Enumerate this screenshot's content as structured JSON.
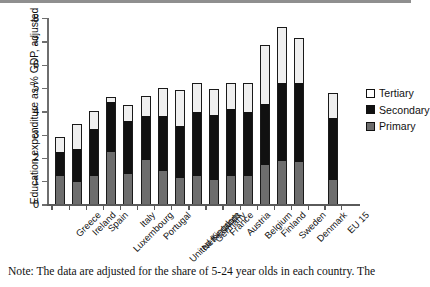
{
  "figure": {
    "note": "Note: The data are adjusted for the share of 5-24 year olds in each country. The"
  },
  "legend": {
    "position": "right",
    "items": [
      {
        "label": "Tertiary",
        "color": "#ffffff"
      },
      {
        "label": "Secondary",
        "color": "#111111"
      },
      {
        "label": "Primary",
        "color": "#6d6d6d"
      }
    ]
  },
  "chart_data": {
    "type": "bar",
    "stacked": true,
    "title": "",
    "subtitle": "",
    "xlabel": "",
    "ylabel": "Education expenditure as % GDP, adjusted",
    "ylim": [
      0,
      8
    ],
    "yticks": [
      0,
      1,
      2,
      3,
      4,
      5,
      6,
      7,
      8
    ],
    "ytick_labels": [
      "0",
      "1",
      "2",
      "3",
      "4",
      "5",
      "6",
      "7",
      "8"
    ],
    "grid": false,
    "categories": [
      "Greece",
      "Ireland",
      "Spain",
      "Luxembourg",
      "Italy",
      "Portugal",
      "United Kingdom",
      "Netherlands",
      "Germany",
      "France",
      "Austria",
      "Belgium",
      "Finland",
      "Sweden",
      "Denmark",
      "EU 15"
    ],
    "series": [
      {
        "name": "Primary",
        "color": "#6d6d6d",
        "values": [
          1.2,
          0.95,
          1.2,
          2.25,
          1.3,
          1.9,
          1.45,
          1.15,
          1.2,
          1.05,
          1.2,
          1.2,
          1.7,
          1.85,
          1.8,
          1.05
        ]
      },
      {
        "name": "Secondary",
        "color": "#111111",
        "values": [
          1.05,
          1.45,
          2.05,
          2.15,
          2.3,
          1.9,
          2.33,
          2.2,
          2.75,
          2.8,
          2.9,
          2.78,
          2.6,
          3.35,
          3.4,
          2.65
        ]
      },
      {
        "name": "Tertiary",
        "color": "#efefef",
        "values": [
          0.65,
          1.05,
          0.75,
          0.2,
          0.65,
          0.85,
          1.22,
          1.55,
          1.25,
          1.1,
          1.1,
          1.22,
          2.55,
          2.4,
          1.95,
          1.1
        ]
      }
    ],
    "totals": [
      2.9,
      3.45,
      4.0,
      4.6,
      4.25,
      4.65,
      5.0,
      4.9,
      5.2,
      4.95,
      5.2,
      5.2,
      6.85,
      7.6,
      7.15,
      4.8
    ],
    "cumulative_tops": {
      "primary": [
        1.2,
        0.95,
        1.2,
        2.25,
        1.3,
        1.9,
        1.45,
        1.15,
        1.2,
        1.05,
        1.2,
        1.2,
        1.7,
        1.85,
        1.8,
        1.05
      ],
      "secondary": [
        2.25,
        2.4,
        3.25,
        4.4,
        3.6,
        3.8,
        3.78,
        3.35,
        3.95,
        3.85,
        4.1,
        3.98,
        4.3,
        5.2,
        5.2,
        3.7
      ]
    },
    "gap_before_last_category": true
  }
}
